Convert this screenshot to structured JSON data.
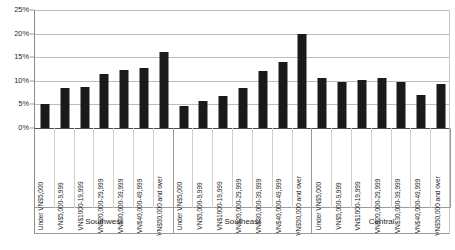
{
  "chart_data": {
    "type": "bar",
    "title": "",
    "subtitle": "",
    "xlabel": "",
    "ylabel": "",
    "ylim": [
      0,
      25
    ],
    "y_tick_labels": [
      "0%",
      "5%",
      "10%",
      "15%",
      "20%",
      "25%"
    ],
    "y_ticks": [
      0,
      5,
      10,
      15,
      20,
      25
    ],
    "grid": true,
    "legend": "none",
    "orientation": "vertical",
    "bar_color": "#1a1a1a",
    "gridline_color": "#bdbdbd",
    "background_color": "#ffffff",
    "groups": [
      "Southwest",
      "Southeast",
      "Central"
    ],
    "categories": [
      "Under VN$5,000",
      "VN$5,000-9,999",
      "VN$1000-19,999",
      "VN$20,000-29,999",
      "VN$30,000-39,999",
      "VN$40,000-49,999",
      "VN$50,000 and over"
    ],
    "series": [
      {
        "name": "Southwest",
        "values": [
          5.0,
          8.5,
          8.7,
          11.5,
          12.2,
          12.8,
          16.2
        ]
      },
      {
        "name": "Southeast",
        "values": [
          4.6,
          5.8,
          6.8,
          8.5,
          12.0,
          14.0,
          20.0
        ]
      },
      {
        "name": "Central",
        "values": [
          10.5,
          9.8,
          10.2,
          10.7,
          9.8,
          7.0,
          9.3
        ]
      }
    ],
    "bars": [
      {
        "group": "Southwest",
        "category": "Under VN$5,000",
        "value": 5.0
      },
      {
        "group": "Southwest",
        "category": "VN$5,000-9,999",
        "value": 8.5
      },
      {
        "group": "Southwest",
        "category": "VN$1000-19,999",
        "value": 8.7
      },
      {
        "group": "Southwest",
        "category": "VN$20,000-29,999",
        "value": 11.5
      },
      {
        "group": "Southwest",
        "category": "VN$30,000-39,999",
        "value": 12.2
      },
      {
        "group": "Southwest",
        "category": "VN$40,000-49,999",
        "value": 12.8
      },
      {
        "group": "Southwest",
        "category": "VN$50,000 and over",
        "value": 16.2
      },
      {
        "group": "Southeast",
        "category": "Under VN$5,000",
        "value": 4.6
      },
      {
        "group": "Southeast",
        "category": "VN$5,000-9,999",
        "value": 5.8
      },
      {
        "group": "Southeast",
        "category": "VN$1000-19,999",
        "value": 6.8
      },
      {
        "group": "Southeast",
        "category": "VN$20,000-29,999",
        "value": 8.5
      },
      {
        "group": "Southeast",
        "category": "VN$30,000-39,999",
        "value": 12.0
      },
      {
        "group": "Southeast",
        "category": "VN$40,000-49,999",
        "value": 14.0
      },
      {
        "group": "Southeast",
        "category": "VN$50,000 and over",
        "value": 20.0
      },
      {
        "group": "Central",
        "category": "Under VN$5,000",
        "value": 10.5
      },
      {
        "group": "Central",
        "category": "VN$5,000-9,999",
        "value": 9.8
      },
      {
        "group": "Central",
        "category": "VN$1000-19,999",
        "value": 10.2
      },
      {
        "group": "Central",
        "category": "VN$20,000-29,999",
        "value": 10.7
      },
      {
        "group": "Central",
        "category": "VN$30,000-39,999",
        "value": 9.8
      },
      {
        "group": "Central",
        "category": "VN$40,000-49,999",
        "value": 7.0
      },
      {
        "group": "Central",
        "category": "VN$50,000 and over",
        "value": 9.3
      }
    ]
  }
}
